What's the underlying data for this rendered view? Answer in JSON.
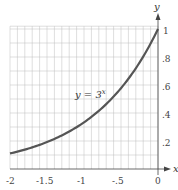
{
  "chart_data": {
    "type": "line",
    "title": "",
    "xlabel": "x",
    "ylabel": "y",
    "xlim": [
      -2,
      0
    ],
    "ylim": [
      0,
      1
    ],
    "grid": true,
    "x_ticks": [
      -2,
      -1.5,
      -1,
      -0.5,
      0
    ],
    "x_tick_labels": [
      "-2",
      "-1.5",
      "-1",
      "-.5",
      "0"
    ],
    "y_ticks": [
      0.2,
      0.4,
      0.6,
      0.8,
      1
    ],
    "y_tick_labels": [
      ".2",
      ".4",
      ".6",
      ".8",
      "1"
    ],
    "series": [
      {
        "name": "y = 3^x",
        "x": [
          -2,
          -1.75,
          -1.5,
          -1.25,
          -1,
          -0.75,
          -0.5,
          -0.25,
          0
        ],
        "values": [
          0.111,
          0.146,
          0.192,
          0.253,
          0.333,
          0.439,
          0.577,
          0.76,
          1.0
        ]
      }
    ],
    "annotations": [
      {
        "text": "y = 3",
        "superscript": "x",
        "x": -0.95,
        "y": 0.6
      }
    ]
  },
  "labels": {
    "x_axis": "x",
    "y_axis": "y",
    "curve_label_base": "y = 3",
    "curve_label_exp": "x",
    "xticks": [
      "-2",
      "-1.5",
      "-1",
      "-.5",
      "0"
    ],
    "yticks": [
      ".2",
      ".4",
      ".6",
      ".8",
      "1"
    ]
  }
}
